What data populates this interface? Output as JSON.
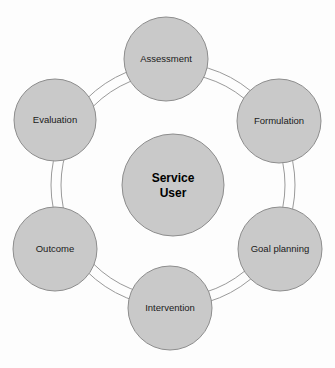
{
  "diagram": {
    "type": "cyclical-process-ring",
    "background_color": "#fdfdfd",
    "node_fill_color": "#c9c9c9",
    "node_stroke_color": "#8d8d8d",
    "arc_stroke_color": "#9a9a9a",
    "label_color": "#1a1a1a",
    "center": {
      "name": "service-user",
      "line1": "Service",
      "line2": "User",
      "cx": 173,
      "cy": 185,
      "r": 51
    },
    "ring": {
      "outer_radius": 122,
      "inner_radius": 112,
      "cx": 173,
      "cy": 185
    },
    "nodes": [
      {
        "id": "assessment",
        "label": "Assessment",
        "cx": 166,
        "cy": 59,
        "r": 42,
        "angle_deg": 270,
        "order": 1
      },
      {
        "id": "formulation",
        "label": "Formulation",
        "cx": 279,
        "cy": 121,
        "r": 42,
        "angle_deg": 330,
        "order": 2
      },
      {
        "id": "goal-planning",
        "label": "Goal planning",
        "cx": 280,
        "cy": 249,
        "r": 42,
        "angle_deg": 30,
        "order": 3
      },
      {
        "id": "intervention",
        "label": "Intervention",
        "cx": 170,
        "cy": 308,
        "r": 42,
        "angle_deg": 90,
        "order": 4
      },
      {
        "id": "outcome",
        "label": "Outcome",
        "cx": 55,
        "cy": 249,
        "r": 42,
        "angle_deg": 150,
        "order": 5
      },
      {
        "id": "evaluation",
        "label": "Evaluation",
        "cx": 55,
        "cy": 120,
        "r": 41,
        "angle_deg": 210,
        "order": 6
      }
    ]
  }
}
